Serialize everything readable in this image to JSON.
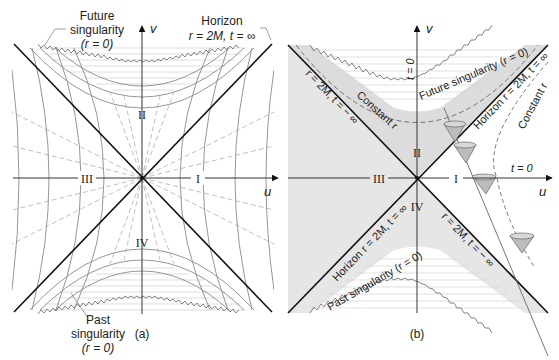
{
  "figure": {
    "panel_a": {
      "caption": "(a)",
      "axis_v": "v",
      "axis_u": "u",
      "regions": [
        "I",
        "II",
        "III",
        "IV"
      ],
      "future_singularity": {
        "line1": "Future",
        "line2": "singularity",
        "line3": "(r = 0)"
      },
      "horizon": {
        "line1": "Horizon",
        "line2": "r = 2M, t = ∞"
      },
      "past_singularity": {
        "line1": "Past",
        "line2": "singularity",
        "line3": "(r = 0)"
      }
    },
    "panel_b": {
      "caption": "(b)",
      "axis_v": "v",
      "axis_u": "u",
      "regions": [
        "I",
        "II",
        "III",
        "IV"
      ],
      "future_singularity": "Future singularity (r = 0)",
      "past_singularity": "Past singularity (r = 0)",
      "horizon_upper_right": "Horizon r = 2M, t = ∞",
      "horizon_lower_left": "Horizon r = 2M, t = ∞",
      "upper_left_line": "r = 2M, t = − ∞",
      "lower_right_line": "r = 2M, t = − ∞",
      "constant_r_inside": "Constant r",
      "constant_r_outside": "Constant r",
      "t_zero_vertical": "t = 0",
      "t_zero_horizontal": "t = 0"
    },
    "colors": {
      "shade_gray": "#e4e4e4",
      "line_dark": "#1a1a1a",
      "line_gray": "#888888",
      "dash_gray": "#b0b0b0",
      "cone_fill": "#bdbdbd"
    }
  }
}
